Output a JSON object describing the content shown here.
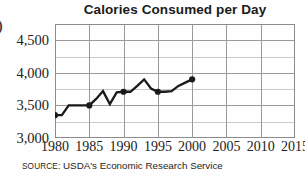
{
  "figure": {
    "edge_fragment": ")",
    "title": "Calories Consumed per Day",
    "source_keyword": "Source:",
    "source_text": "USDA's Economic Research Service",
    "colors": {
      "line": "#1a1a1a",
      "grid": "#a8a8a8",
      "frame": "#8c8c8c",
      "text": "#232323",
      "background": "#ffffff"
    }
  },
  "chart_data": {
    "type": "line",
    "title": "Calories Consumed per Day",
    "xlabel": "",
    "ylabel": "",
    "xlim": [
      1980,
      2015
    ],
    "ylim": [
      3000,
      4750
    ],
    "grid": true,
    "legend": "none",
    "x_ticks": [
      1980,
      1985,
      1990,
      1995,
      2000,
      2005,
      2010,
      2015
    ],
    "x_tick_labels": [
      "1980",
      "1985",
      "1990",
      "1995",
      "2000",
      "2005",
      "2010",
      "2015"
    ],
    "y_ticks": [
      3000,
      3500,
      4000,
      4500
    ],
    "y_tick_labels": [
      "3,000",
      "3,500",
      "4,000",
      "4,500"
    ],
    "y_minor_ticks": [
      3250,
      3750,
      4250
    ],
    "marker_years": [
      1980,
      1985,
      1990,
      1995,
      2000
    ],
    "series": [
      {
        "name": "Calories consumed per day",
        "x": [
          1980,
          1981,
          1982,
          1983,
          1984,
          1985,
          1986,
          1987,
          1988,
          1989,
          1990,
          1991,
          1992,
          1993,
          1994,
          1995,
          1996,
          1997,
          1998,
          1999,
          2000
        ],
        "values": [
          3350,
          3350,
          3500,
          3500,
          3500,
          3500,
          3600,
          3720,
          3520,
          3700,
          3710,
          3710,
          3800,
          3900,
          3760,
          3710,
          3710,
          3720,
          3800,
          3850,
          3900
        ]
      }
    ],
    "annotations": [],
    "source": "Source: USDA's Economic Research Service"
  }
}
